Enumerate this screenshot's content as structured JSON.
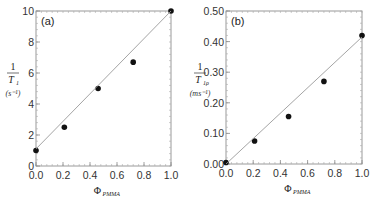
{
  "chart_data": [
    {
      "type": "scatter",
      "panel_label": "(a)",
      "title": "",
      "xlabel": "Φ_PMMA",
      "xlabel_symbol": "Φ",
      "xlabel_sub": "PMMA",
      "ylabel": "1/T1 (s^-1)",
      "ylabel_num": "1",
      "ylabel_den": "T",
      "ylabel_den_sub": "1",
      "ylabel_unit": "(s⁻¹)",
      "xlim": [
        0.0,
        1.0
      ],
      "ylim": [
        0,
        10
      ],
      "xticks": [
        "0.0",
        "0.2",
        "0.4",
        "0.6",
        "0.8",
        "1.0"
      ],
      "yticks": [
        "0",
        "2",
        "4",
        "6",
        "8",
        "10"
      ],
      "grid": false,
      "series": [
        {
          "name": "measured",
          "marker": "filled-circle",
          "x": [
            0.0,
            0.21,
            0.46,
            0.72,
            1.0
          ],
          "y": [
            1.0,
            2.5,
            5.0,
            6.7,
            10.0
          ]
        },
        {
          "name": "fit",
          "style": "line",
          "x": [
            0.0,
            1.0
          ],
          "y": [
            1.1,
            10.0
          ]
        }
      ]
    },
    {
      "type": "scatter",
      "panel_label": "(b)",
      "title": "",
      "xlabel": "Φ_PMMA",
      "xlabel_symbol": "Φ",
      "xlabel_sub": "PMMA",
      "ylabel": "1/T1ρ (ms^-1)",
      "ylabel_num": "1",
      "ylabel_den": "T",
      "ylabel_den_sub": "1ρ",
      "ylabel_unit": "(ms⁻¹)",
      "xlim": [
        0.0,
        1.0
      ],
      "ylim": [
        0.0,
        0.5
      ],
      "xticks": [
        "0.0",
        "0.2",
        "0.4",
        "0.6",
        "0.8",
        "1.0"
      ],
      "yticks": [
        "0.00",
        "0.10",
        "0.20",
        "0.30",
        "0.40",
        "0.50"
      ],
      "grid": false,
      "series": [
        {
          "name": "measured",
          "marker": "filled-circle",
          "x": [
            0.0,
            0.21,
            0.46,
            0.72,
            1.0
          ],
          "y": [
            0.005,
            0.075,
            0.155,
            0.27,
            0.42
          ]
        },
        {
          "name": "fit",
          "style": "line",
          "x": [
            0.0,
            1.0
          ],
          "y": [
            0.0,
            0.415
          ]
        }
      ]
    }
  ]
}
